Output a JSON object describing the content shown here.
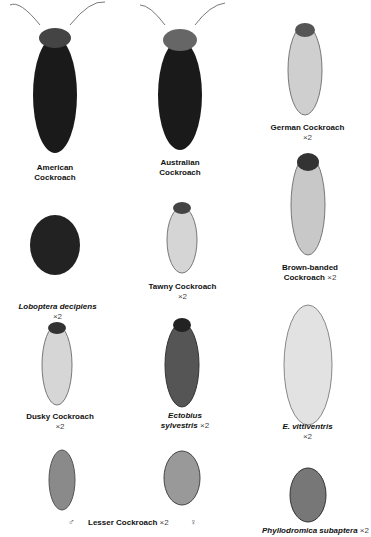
{
  "species": [
    {
      "id": "american",
      "name": "American",
      "name2": "Cockroach",
      "scale": ""
    },
    {
      "id": "australian",
      "name": "Australian",
      "name2": "Cockroach",
      "scale": ""
    },
    {
      "id": "german",
      "name": "German Cockroach",
      "scale": "×2"
    },
    {
      "id": "loboptera",
      "name": "Loboptera decipiens",
      "scale": "×2",
      "italic": true
    },
    {
      "id": "tawny",
      "name": "Tawny Cockroach",
      "scale": "×2"
    },
    {
      "id": "brownbanded",
      "name": "Brown-banded",
      "name2": "Cockroach",
      "scale": "×2"
    },
    {
      "id": "dusky",
      "name": "Dusky Cockroach",
      "scale": "×2"
    },
    {
      "id": "ectobius",
      "name": "Ectobius",
      "name2": "sylvestris",
      "scale": "×2",
      "italic": true
    },
    {
      "id": "vittiventris",
      "name": "E. vittiventris",
      "scale": "×2",
      "italic": true
    },
    {
      "id": "lesser",
      "name": "Lesser Cockroach",
      "scale": "×2"
    },
    {
      "id": "phyllodromica",
      "name": "Phyllodromica subaptera",
      "scale": "×2",
      "italic": true
    }
  ],
  "symbols": {
    "male": "♂",
    "female": "♀"
  }
}
